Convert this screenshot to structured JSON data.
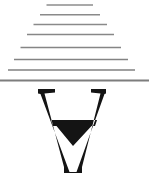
{
  "figure": {
    "background_color": "#ffffff",
    "width": 149,
    "height": 193
  },
  "pyramid": {
    "name": "stacked-rules",
    "line_color": "#8d8d8d",
    "line_count": 8,
    "orientation": "horizontal",
    "arrangement": "centered, widening downward",
    "lines": [
      {
        "index": 1,
        "x1": 46.5,
        "x2": 93.0,
        "y": 5.0,
        "thickness": 1.5,
        "color": "#8d8d8d"
      },
      {
        "index": 2,
        "x1": 40.0,
        "x2": 100.0,
        "y": 14.8,
        "thickness": 1.5,
        "color": "#8a8a8a"
      },
      {
        "index": 3,
        "x1": 33.5,
        "x2": 107.0,
        "y": 24.6,
        "thickness": 1.5,
        "color": "#8a8a8a"
      },
      {
        "index": 4,
        "x1": 27.0,
        "x2": 114.0,
        "y": 34.4,
        "thickness": 1.5,
        "color": "#878787"
      },
      {
        "index": 5,
        "x1": 20.5,
        "x2": 121.0,
        "y": 47.5,
        "thickness": 1.6,
        "color": "#858585"
      },
      {
        "index": 6,
        "x1": 14.0,
        "x2": 128.0,
        "y": 59.5,
        "thickness": 1.7,
        "color": "#838383"
      },
      {
        "index": 7,
        "x1": 8.0,
        "x2": 135.0,
        "y": 70.0,
        "thickness": 1.7,
        "color": "#808080"
      },
      {
        "index": 8,
        "x1": 0.0,
        "x2": 149.0,
        "y": 80.5,
        "thickness": 1.8,
        "color": "#7d7d7d"
      }
    ]
  },
  "glyph": {
    "name": "inverted-a",
    "symbol": "∀",
    "meaning": "for all / universal quantifier",
    "style": "bold serif, rotated 180 degrees",
    "fill_color": "#141414",
    "bounds": {
      "x": 38,
      "y": 89,
      "width": 68,
      "height": 84
    },
    "crossbar": {
      "y": 120,
      "x1": 54,
      "x2": 94,
      "thickness": 6
    },
    "apex": {
      "x": 73,
      "y": 172
    },
    "serif_left": {
      "x1": 38,
      "x2": 55,
      "y": 89
    },
    "serif_right": {
      "x1": 91,
      "x2": 107,
      "y": 89
    }
  }
}
